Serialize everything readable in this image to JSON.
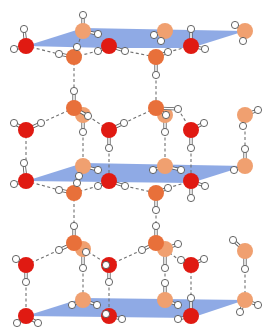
{
  "colors": {
    "plane": "#7b9be0",
    "oxygen_front": "#e01a12",
    "oxygen_mid": "#e8703a",
    "oxygen_back": "#f0a070",
    "hydrogen": "#ffffff",
    "hbond": "#707070"
  },
  "planes": [
    {
      "points": "26,46 83,28 245,31 191,48 109,48"
    },
    {
      "points": "26,181 83,163 245,166 191,183"
    },
    {
      "points": "26,316 83,298 245,300 191,318"
    }
  ],
  "molecules": [
    {
      "o": [
        26,
        46
      ],
      "c": "oxygen_front",
      "h": [
        [
          24,
          29
        ],
        [
          14,
          49
        ]
      ]
    },
    {
      "o": [
        83,
        31
      ],
      "c": "oxygen_back",
      "h": [
        [
          83,
          15
        ],
        [
          98,
          34
        ]
      ]
    },
    {
      "o": [
        109,
        46
      ],
      "c": "oxygen_front",
      "h": [
        [
          98,
          51
        ],
        [
          125,
          51
        ]
      ]
    },
    {
      "o": [
        74,
        57
      ],
      "c": "oxygen_mid",
      "h": [
        [
          59,
          54
        ],
        [
          77,
          47
        ]
      ]
    },
    {
      "o": [
        165,
        31
      ],
      "c": "oxygen_back",
      "h": [
        [
          154,
          35
        ],
        [
          161,
          41
        ]
      ]
    },
    {
      "o": [
        191,
        46
      ],
      "c": "oxygen_front",
      "h": [
        [
          191,
          29
        ],
        [
          205,
          49
        ]
      ]
    },
    {
      "o": [
        156,
        57
      ],
      "c": "oxygen_mid",
      "h": [
        [
          168,
          52
        ],
        [
          156,
          75
        ]
      ]
    },
    {
      "o": [
        245,
        31
      ],
      "c": "oxygen_back",
      "h": [
        [
          235,
          25
        ],
        [
          243,
          41
        ]
      ]
    },
    {
      "o": [
        74,
        108
      ],
      "c": "oxygen_mid",
      "h": [
        [
          74,
          91
        ],
        [
          88,
          116
        ]
      ]
    },
    {
      "o": [
        83,
        115
      ],
      "c": "oxygen_back",
      "h": [
        [
          83,
          132
        ]
      ]
    },
    {
      "o": [
        156,
        108
      ],
      "c": "oxygen_mid",
      "h": [
        [
          166,
          115
        ],
        [
          178,
          109
        ]
      ]
    },
    {
      "o": [
        165,
        115
      ],
      "c": "oxygen_back",
      "h": [
        [
          165,
          132
        ]
      ]
    },
    {
      "o": [
        245,
        115
      ],
      "c": "oxygen_back",
      "h": [
        [
          258,
          110
        ],
        [
          243,
          126
        ]
      ]
    },
    {
      "o": [
        26,
        130
      ],
      "c": "oxygen_front",
      "h": [
        [
          14,
          123
        ],
        [
          41,
          123
        ]
      ]
    },
    {
      "o": [
        109,
        130
      ],
      "c": "oxygen_front",
      "h": [
        [
          109,
          148
        ],
        [
          124,
          123
        ]
      ]
    },
    {
      "o": [
        191,
        130
      ],
      "c": "oxygen_front",
      "h": [
        [
          191,
          148
        ],
        [
          204,
          123
        ]
      ]
    },
    {
      "o": [
        83,
        166
      ],
      "c": "oxygen_back",
      "h": [
        [
          98,
          170
        ],
        [
          79,
          176
        ]
      ]
    },
    {
      "o": [
        165,
        166
      ],
      "c": "oxygen_back",
      "h": [
        [
          153,
          170
        ],
        [
          181,
          170
        ]
      ]
    },
    {
      "o": [
        245,
        166
      ],
      "c": "oxygen_back",
      "h": [
        [
          245,
          149
        ],
        [
          234,
          170
        ]
      ]
    },
    {
      "o": [
        26,
        181
      ],
      "c": "oxygen_front",
      "h": [
        [
          24,
          163
        ],
        [
          14,
          184
        ]
      ]
    },
    {
      "o": [
        109,
        181
      ],
      "c": "oxygen_front",
      "h": [
        [
          98,
          186
        ],
        [
          125,
          186
        ]
      ]
    },
    {
      "o": [
        191,
        181
      ],
      "c": "oxygen_front",
      "h": [
        [
          191,
          198
        ],
        [
          205,
          186
        ]
      ]
    },
    {
      "o": [
        74,
        193
      ],
      "c": "oxygen_mid",
      "h": [
        [
          59,
          190
        ],
        [
          77,
          183
        ]
      ]
    },
    {
      "o": [
        156,
        193
      ],
      "c": "oxygen_mid",
      "h": [
        [
          168,
          188
        ],
        [
          156,
          210
        ]
      ]
    },
    {
      "o": [
        74,
        243
      ],
      "c": "oxygen_mid",
      "h": [
        [
          74,
          226
        ],
        [
          59,
          250
        ]
      ]
    },
    {
      "o": [
        83,
        249
      ],
      "c": "oxygen_back",
      "h": [
        [
          86,
          252
        ],
        [
          83,
          268
        ]
      ]
    },
    {
      "o": [
        156,
        243
      ],
      "c": "oxygen_mid",
      "h": [
        [
          156,
          226
        ],
        [
          142,
          250
        ]
      ]
    },
    {
      "o": [
        165,
        249
      ],
      "c": "oxygen_back",
      "h": [
        [
          178,
          244
        ],
        [
          165,
          268
        ]
      ]
    },
    {
      "o": [
        245,
        251
      ],
      "c": "oxygen_back",
      "h": [
        [
          233,
          240
        ],
        [
          245,
          269
        ]
      ]
    },
    {
      "o": [
        26,
        265
      ],
      "c": "oxygen_front",
      "h": [
        [
          16,
          259
        ],
        [
          26,
          282
        ]
      ]
    },
    {
      "o": [
        109,
        265
      ],
      "c": "oxygen_front",
      "h": [
        [
          106,
          265
        ],
        [
          109,
          282
        ]
      ]
    },
    {
      "o": [
        191,
        265
      ],
      "c": "oxygen_front",
      "h": [
        [
          181,
          260
        ],
        [
          204,
          259
        ]
      ]
    },
    {
      "o": [
        83,
        300
      ],
      "c": "oxygen_back",
      "h": [
        [
          72,
          305
        ],
        [
          97,
          305
        ]
      ]
    },
    {
      "o": [
        165,
        300
      ],
      "c": "oxygen_back",
      "h": [
        [
          165,
          283
        ],
        [
          178,
          305
        ]
      ]
    },
    {
      "o": [
        245,
        300
      ],
      "c": "oxygen_back",
      "h": [
        [
          240,
          312
        ],
        [
          258,
          305
        ]
      ]
    },
    {
      "o": [
        26,
        316
      ],
      "c": "oxygen_front",
      "h": [
        [
          17,
          323
        ],
        [
          38,
          323
        ]
      ]
    },
    {
      "o": [
        109,
        316
      ],
      "c": "oxygen_front",
      "h": [
        [
          106,
          314
        ],
        [
          122,
          319
        ]
      ]
    },
    {
      "o": [
        191,
        316
      ],
      "c": "oxygen_front",
      "h": [
        [
          178,
          319
        ],
        [
          191,
          298
        ]
      ]
    }
  ],
  "hbonds": [
    [
      14,
      49,
      26,
      46
    ],
    [
      26,
      46,
      59,
      54
    ],
    [
      77,
      47,
      83,
      31
    ],
    [
      98,
      51,
      74,
      57
    ],
    [
      125,
      51,
      156,
      57
    ],
    [
      168,
      52,
      191,
      46
    ],
    [
      74,
      57,
      74,
      91
    ],
    [
      156,
      75,
      156,
      108
    ],
    [
      74,
      108,
      41,
      123
    ],
    [
      88,
      116,
      109,
      130
    ],
    [
      83,
      132,
      83,
      166
    ],
    [
      26,
      130,
      26,
      163
    ],
    [
      109,
      148,
      109,
      181
    ],
    [
      156,
      108,
      124,
      123
    ],
    [
      178,
      109,
      191,
      130
    ],
    [
      165,
      132,
      165,
      166
    ],
    [
      191,
      148,
      191,
      181
    ],
    [
      245,
      126,
      245,
      149
    ],
    [
      26,
      181,
      59,
      190
    ],
    [
      98,
      186,
      74,
      193
    ],
    [
      125,
      186,
      156,
      193
    ],
    [
      168,
      188,
      191,
      181
    ],
    [
      74,
      193,
      74,
      226
    ],
    [
      156,
      210,
      156,
      226
    ],
    [
      26,
      265,
      59,
      250
    ],
    [
      74,
      243,
      109,
      265
    ],
    [
      109,
      265,
      142,
      250
    ],
    [
      156,
      243,
      178,
      259
    ],
    [
      26,
      282,
      26,
      316
    ],
    [
      83,
      268,
      83,
      300
    ],
    [
      109,
      282,
      109,
      316
    ],
    [
      165,
      268,
      165,
      283
    ],
    [
      191,
      265,
      191,
      298
    ],
    [
      245,
      269,
      245,
      300
    ]
  ]
}
